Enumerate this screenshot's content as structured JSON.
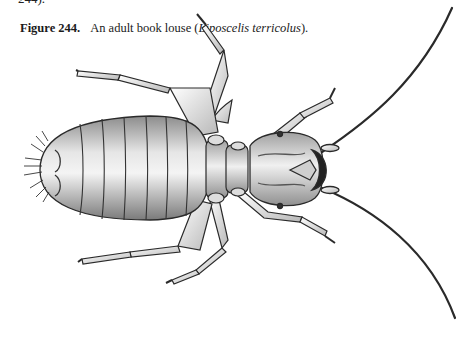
{
  "page": {
    "top_fragment": "244).",
    "figure": {
      "label": "Figure 244.",
      "caption_prefix": "An adult book louse (",
      "species": "Liposcelis terricolus",
      "caption_suffix": ")."
    },
    "illustration": {
      "subject": "adult book louse",
      "view": "dorsal",
      "orientation": "head pointing right",
      "ink_color": "#222222",
      "shade_color": "#9a9a9a",
      "paper_color": "#ffffff"
    }
  }
}
